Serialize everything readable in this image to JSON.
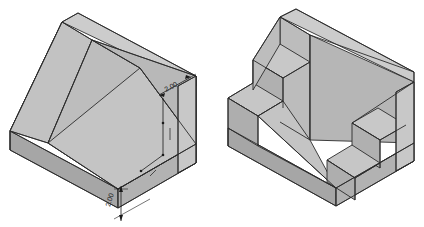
{
  "figure": {
    "background_color": "#ffffff",
    "line_color": "#2b2b2b",
    "views": [
      {
        "name": "left-view",
        "label": "Inclined ramp block with rectangular pocket",
        "dimensions": [
          {
            "id": "dim-upper-right",
            "value": "2.00",
            "orientation": "inclined-receding",
            "position": "upper-right-face"
          },
          {
            "id": "dim-lower-front",
            "value": "2.00",
            "orientation": "vertical",
            "position": "lower-front-base"
          }
        ],
        "face_shades": {
          "top": "#c9c9c9",
          "ramp": "#bdbdbd",
          "front_right": "#c4c4c4",
          "left_side": "#b4b4b4",
          "pocket_floor": "#c2c2c2",
          "pocket_back": "#b8b8b8",
          "base_front": "#aeaeae",
          "base_left": "#a6a6a6"
        }
      },
      {
        "name": "right-view",
        "label": "Stepped block with twin stair recesses",
        "dimensions": [],
        "face_shades": {
          "top": "#c9c9c9",
          "ramp": "#bdbdbd",
          "front_right": "#c4c4c4",
          "left_side": "#b4b4b4",
          "step_tread": "#c6c6c6",
          "step_riser": "#b0b0b0",
          "base_front": "#aeaeae",
          "base_left": "#a6a6a6"
        }
      }
    ]
  }
}
